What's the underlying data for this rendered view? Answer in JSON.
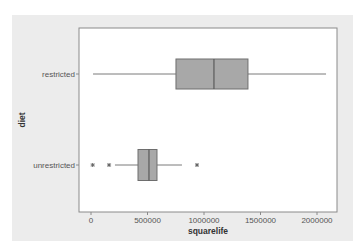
{
  "chart_data": {
    "type": "boxplot",
    "orientation": "horizontal",
    "title": "",
    "xlabel": "squarelife",
    "ylabel": "diet",
    "xlim": [
      -100000,
      2200000
    ],
    "xticks": [
      0,
      500000,
      1000000,
      1500000,
      2000000
    ],
    "xtick_labels": [
      "0",
      "500000",
      "1000000",
      "1500000",
      "2000000"
    ],
    "categories": [
      "restricted",
      "unrestricted"
    ],
    "grid": false,
    "legend": null,
    "series": [
      {
        "name": "restricted",
        "whisker_low": 18000,
        "q1": 752000,
        "median": 1088000,
        "q3": 1389000,
        "whisker_high": 2080000,
        "outliers": []
      },
      {
        "name": "unrestricted",
        "whisker_low": 212000,
        "q1": 416000,
        "median": 513000,
        "q3": 584000,
        "whisker_high": 805000,
        "outliers": [
          15000,
          160000,
          938000
        ]
      }
    ],
    "colors": {
      "panel_background": "#ececec",
      "plot_background": "#ffffff",
      "box_fill": "#a8a8a8",
      "box_stroke": "#6e6e6e",
      "whisker": "#7a7a7a",
      "outlier": "#666666"
    }
  }
}
